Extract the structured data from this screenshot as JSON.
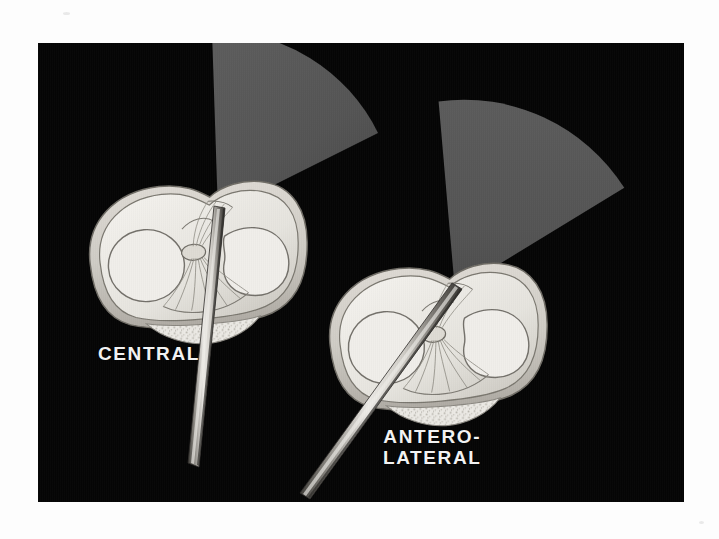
{
  "figure": {
    "kind": "medical-illustration",
    "background_color": "#050505",
    "page_color": "#fdfdfd",
    "plate": {
      "x": 38,
      "y": 43,
      "width": 646,
      "height": 459
    }
  },
  "labels": {
    "left": {
      "text": "CENTRAL",
      "color": "#f2f2f2"
    },
    "right": {
      "line1": "ANTERO-",
      "line2": "LATERAL",
      "color": "#f2f2f2"
    }
  },
  "panels": [
    {
      "id": "central-portal",
      "label": "CENTRAL",
      "scope_angle_deg": 12,
      "view_cone": {
        "fill": "#565656",
        "apex": [
          180,
          170
        ],
        "radius": 182,
        "start_angle_deg": 268,
        "end_angle_deg": 352
      },
      "instrument": {
        "name": "arthroscope",
        "tip": [
          181,
          171
        ],
        "tail": [
          152,
          420
        ],
        "body_color": "#d8d6d2",
        "shadow_color": "#5a5852"
      },
      "anatomy": {
        "name": "tibial-plateau-axial",
        "center": [
          160,
          215
        ],
        "width": 215,
        "height": 148,
        "tissue_color": "#e3e1dc",
        "outline_color": "#6d6a64"
      }
    },
    {
      "id": "anterolateral-portal",
      "label": "ANTERO-LATERAL",
      "scope_angle_deg": 34,
      "view_cone": {
        "fill": "#565656",
        "apex": [
          417,
          248
        ],
        "radius": 196,
        "start_angle_deg": 272,
        "end_angle_deg": 356
      },
      "instrument": {
        "name": "arthroscope",
        "tip": [
          418,
          249
        ],
        "tail": [
          262,
          452
        ],
        "body_color": "#d8d6d2",
        "shadow_color": "#5a5852"
      },
      "anatomy": {
        "name": "tibial-plateau-axial",
        "center": [
          400,
          297
        ],
        "width": 215,
        "height": 148,
        "tissue_color": "#e3e1dc",
        "outline_color": "#6d6a64"
      }
    }
  ],
  "palette": {
    "plate_black": "#050505",
    "cone_gray": "#565656",
    "tissue_light": "#eceae6",
    "tissue_mid": "#d9d7d1",
    "tissue_shadow": "#b8b5ae",
    "outline": "#6b6861",
    "instrument_light": "#e6e4e0",
    "instrument_dark": "#4e4c47",
    "label_white": "#f2f2f2"
  }
}
